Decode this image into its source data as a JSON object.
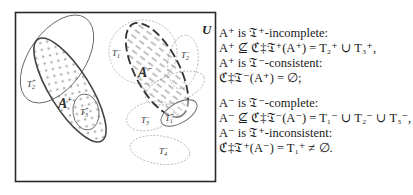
{
  "diagram": {
    "universe_label": "U",
    "sets": [
      {
        "id": "A_plus",
        "label": "A",
        "sup": "+",
        "style": "solid-thick",
        "fill": "stars"
      },
      {
        "id": "A_minus",
        "label": "A",
        "sup": "−",
        "style": "dashed-thick",
        "fill": "dashes"
      },
      {
        "id": "T2_plus",
        "label": "T",
        "sub": "2",
        "sup": "+",
        "style": "solid-thin"
      },
      {
        "id": "T3_plus",
        "label": "T",
        "sub": "3",
        "sup": "+",
        "style": "solid-thin"
      },
      {
        "id": "T1_plus",
        "label": "T",
        "sub": "1",
        "sup": "+",
        "style": "solid-thin"
      },
      {
        "id": "T1_minus",
        "label": "T",
        "sub": "1",
        "sup": "−",
        "style": "dotted"
      },
      {
        "id": "T2_minus",
        "label": "T",
        "sub": "2",
        "sup": "−",
        "style": "dotted"
      },
      {
        "id": "T3_minus",
        "label": "T",
        "sub": "3",
        "sup": "−",
        "style": "dotted"
      },
      {
        "id": "T4_minus",
        "label": "T",
        "sub": "4",
        "sup": "−",
        "style": "dotted"
      }
    ],
    "colors": {
      "frame": "#2a2a2a",
      "solid": "#555555",
      "dotted": "#9a9a9a",
      "thick": "#333333"
    }
  },
  "text": {
    "lines": [
      "A⁺ is 𝔗⁺-incomplete:",
      "A⁺ ⊈ ℭ‡𝔗⁺(A⁺) = T₂⁺ ∪ T₃⁺,",
      "A⁺ is 𝔗⁻-consistent:",
      "ℭ‡𝔗⁻(A⁺) = ∅;",
      "",
      "A⁻ is 𝔗⁻-complete:",
      "A⁻ ⊈ ℭ‡𝔗⁻(A⁻) = T₁⁻ ∪ T₂⁻ ∪ T₃⁻,",
      "A⁻ is 𝔗⁺-inconsistent:",
      "ℭ‡𝔗⁺(A⁻) = T₁⁺ ≠ ∅."
    ]
  }
}
